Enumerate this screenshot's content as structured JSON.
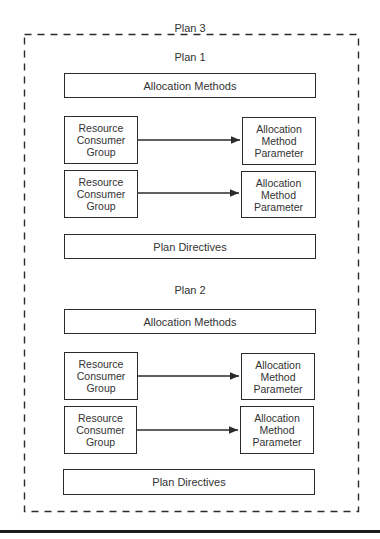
{
  "outer_plan": {
    "label": "Plan 3"
  },
  "plans": [
    {
      "label": "Plan 1",
      "allocation_methods": "Allocation Methods",
      "groups": [
        {
          "source": "Resource Consumer Group",
          "source_lines": [
            "Resource",
            "Consumer",
            "Group"
          ],
          "target": "Allocation Method Parameter",
          "target_lines": [
            "Allocation",
            "Method",
            "Parameter"
          ]
        },
        {
          "source": "Resource Consumer Group",
          "source_lines": [
            "Resource",
            "Consumer",
            "Group"
          ],
          "target": "Allocation Method Parameter",
          "target_lines": [
            "Allocation",
            "Method",
            "Parameter"
          ]
        }
      ],
      "plan_directives": "Plan Directives"
    },
    {
      "label": "Plan 2",
      "allocation_methods": "Allocation Methods",
      "groups": [
        {
          "source": "Resource Consumer Group",
          "source_lines": [
            "Resource",
            "Consumer",
            "Group"
          ],
          "target": "Allocation Method Parameter",
          "target_lines": [
            "Allocation",
            "Method",
            "Parameter"
          ]
        },
        {
          "source": "Resource Consumer Group",
          "source_lines": [
            "Resource",
            "Consumer",
            "Group"
          ],
          "target": "Allocation Method Parameter",
          "target_lines": [
            "Allocation",
            "Method",
            "Parameter"
          ]
        }
      ],
      "plan_directives": "Plan Directives"
    }
  ]
}
